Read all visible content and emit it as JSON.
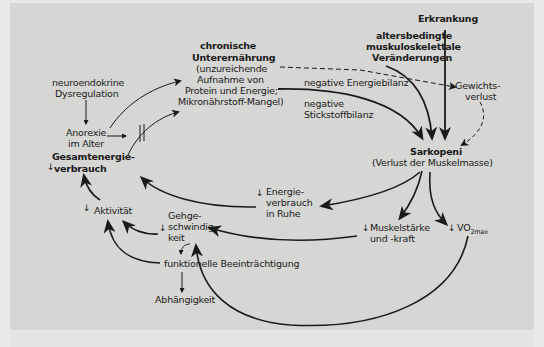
{
  "diagram": {
    "nodes": {
      "erkrankung": "Erkrankung",
      "alters_1": "altersbedingte",
      "alters_2": "muskuloskelettale",
      "alters_3": "Veränderungen",
      "chron_1": "chronische",
      "chron_2": "Unterernährung",
      "chron_3": "(unzureichende",
      "chron_4": "Aufnahme von",
      "chron_5": "Protein und Energie;",
      "chron_6": "Mikronährstoff-Mangel)",
      "neuro_1": "neuroendokrine",
      "neuro_2": "Dysregulation",
      "anorexie_1": "Anorexie",
      "anorexie_2": "im Alter",
      "gesamt_1": "Gesamtenergie-",
      "gesamt_2": "verbrauch",
      "gewicht_1": "Gewichts-",
      "gewicht_2": "verlust",
      "neg_energie": "negative Energiebilanz",
      "neg_stick_1": "negative",
      "neg_stick_2": "Stickstoffbilanz",
      "sarko_1": "Sarkopeni",
      "sarko_2": "(Verlust der Muskelmasse)",
      "energie_ruhe_1": "Energie-",
      "energie_ruhe_2": "verbrauch",
      "energie_ruhe_3": "in Ruhe",
      "aktivitaet": "Aktivität",
      "gehge_1": "Gehge-",
      "gehge_2": "schwindig-",
      "gehge_3": "keit",
      "muskel_1": "Muskelstärke",
      "muskel_2": "und -kraft",
      "vo2": "VO",
      "vo2_sub": "2max",
      "funktionell": "funktionelle Beeinträchtigung",
      "abhaengigkeit": "Abhängigkeit"
    },
    "decrease_marker": "↓",
    "colors": {
      "background": "#d6d6d4",
      "ink": "#1a1a1a"
    }
  }
}
